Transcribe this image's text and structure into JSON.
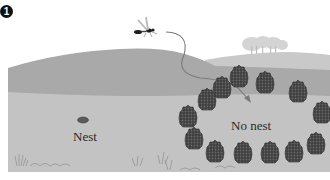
{
  "figure": {
    "panel_number": "1",
    "labels": {
      "nest": "Nest",
      "no_nest": "No nest"
    },
    "elements": {
      "insect": "wasp",
      "flight_path": "curved-arrow",
      "landmarks": "pinecone-ring",
      "landmark_count": 12,
      "background": "trees-on-hill"
    },
    "colors": {
      "sky": "#ffffff",
      "far_hill": "#c9c9c9",
      "near_hill": "#a9a9a9",
      "ground": "#c6c6c6",
      "pinecone": "#4a4a4a",
      "arrow": "#7a7a7a",
      "text": "#2a2a2a"
    }
  }
}
